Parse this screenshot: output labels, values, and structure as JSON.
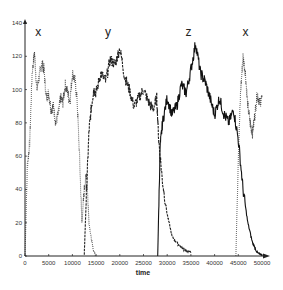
{
  "chart_data": {
    "type": "line",
    "title": "",
    "xlabel": "time",
    "ylabel": "",
    "xlim": [
      0,
      52000
    ],
    "ylim": [
      0,
      140
    ],
    "grid": false,
    "legend": "none",
    "x_ticks": [
      0,
      5000,
      10000,
      15000,
      20000,
      25000,
      30000,
      35000,
      40000,
      45000,
      50000
    ],
    "y_ticks": [
      0,
      20,
      40,
      60,
      80,
      100,
      120,
      140
    ],
    "annotations": [
      {
        "text": "x",
        "x": 2800,
        "y": 132
      },
      {
        "text": "y",
        "x": 17500,
        "y": 132
      },
      {
        "text": "z",
        "x": 34500,
        "y": 132
      },
      {
        "text": "x",
        "x": 46500,
        "y": 132
      }
    ],
    "series": [
      {
        "name": "x",
        "style": "dotted",
        "x": [
          0,
          500,
          1000,
          1500,
          2000,
          2500,
          3000,
          3500,
          4000,
          4500,
          5000,
          5500,
          6000,
          6500,
          7000,
          7500,
          8000,
          8500,
          9000,
          9500,
          10000,
          10500,
          11000,
          11500,
          12000,
          12500,
          13000,
          13500,
          14000,
          14500,
          15000,
          44500,
          45000,
          45500,
          46000,
          46500,
          47000,
          47500,
          48000,
          48500,
          49000,
          49500,
          50000
        ],
        "y": [
          0,
          55,
          68,
          110,
          122,
          100,
          108,
          116,
          112,
          95,
          98,
          88,
          90,
          80,
          85,
          95,
          92,
          103,
          98,
          93,
          110,
          106,
          94,
          60,
          20,
          40,
          50,
          20,
          10,
          3,
          0,
          0,
          60,
          100,
          120,
          110,
          90,
          80,
          74,
          85,
          98,
          92,
          95
        ]
      },
      {
        "name": "y",
        "style": "dashed",
        "x": [
          12500,
          13000,
          13500,
          14000,
          14500,
          15000,
          16000,
          17000,
          18000,
          19000,
          20000,
          21000,
          22000,
          23000,
          24000,
          25000,
          26000,
          27000,
          27800,
          28200,
          29000,
          30000,
          31000,
          32000,
          33000,
          34000,
          35000
        ],
        "y": [
          0,
          40,
          75,
          90,
          100,
          98,
          110,
          105,
          118,
          115,
          125,
          108,
          100,
          90,
          95,
          100,
          93,
          88,
          95,
          70,
          45,
          25,
          12,
          8,
          5,
          3,
          2
        ]
      },
      {
        "name": "z",
        "style": "solid",
        "x": [
          28000,
          28500,
          29000,
          30000,
          31000,
          32000,
          33000,
          34000,
          35000,
          36000,
          37000,
          38000,
          39000,
          40000,
          41000,
          42000,
          43000,
          44000,
          45000,
          46000,
          47000,
          48000,
          49000,
          50000
        ],
        "y": [
          0,
          65,
          80,
          95,
          85,
          90,
          103,
          98,
          112,
          128,
          110,
          105,
          95,
          85,
          95,
          85,
          80,
          88,
          70,
          40,
          20,
          8,
          2,
          0
        ]
      }
    ]
  },
  "axes": {
    "xlabel": "time",
    "x_tick_labels": [
      "0",
      "5000",
      "10000",
      "15000",
      "20000",
      "25000",
      "30000",
      "35000",
      "40000",
      "45000",
      "50000"
    ],
    "y_tick_labels": [
      "0",
      "20",
      "40",
      "60",
      "80",
      "100",
      "120",
      "140"
    ]
  }
}
